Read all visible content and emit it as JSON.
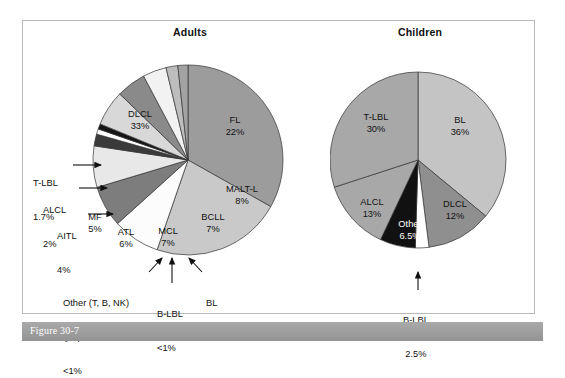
{
  "figure": {
    "caption_label": "Figure 30-7",
    "frame_color": "#b9b9b9",
    "caption_bar_color": "#9d9d9d"
  },
  "charts": [
    {
      "id": "adults",
      "title": "Adults",
      "center": [
        103,
        105
      ],
      "radius": 95
    },
    {
      "id": "children",
      "title": "Children",
      "center": [
        88,
        105
      ],
      "radius": 88
    }
  ],
  "chart_data": [
    {
      "type": "pie",
      "title": "Adults",
      "xlabel": "",
      "ylabel": "",
      "legend": "none",
      "unit": "%",
      "categories": [
        "DLCL",
        "FL",
        "MALT-L",
        "BCLL",
        "MCL",
        "BL",
        "B-LBL",
        "Other (T, B, NK) lymphomas",
        "ATL",
        "MF",
        "AITL",
        "ALCL",
        "T-LBL"
      ],
      "values": [
        33,
        22,
        8,
        7,
        7,
        2,
        0.9,
        0.9,
        6,
        5,
        4,
        2,
        1.7
      ],
      "value_labels": [
        "33%",
        "22%",
        "8%",
        "7%",
        "7%",
        "2%",
        "<1%",
        "<1%",
        "6%",
        "5%",
        "4%",
        "2%",
        "1.7%"
      ],
      "colors": [
        "#9c9c9c",
        "#c9c9c9",
        "#fcfcfc",
        "#7d7d7d",
        "#e8e8e8",
        "#3a3a3a",
        "#ffffff",
        "#151515",
        "#d8d8d8",
        "#8a8a8a",
        "#f2f2f2",
        "#bdbdbd",
        "#a3a3a3"
      ],
      "inside_labels": [
        {
          "name": "DLCL",
          "pct": "33%",
          "x": 55,
          "y": 60,
          "light": false
        },
        {
          "name": "FL",
          "pct": "22%",
          "x": 150,
          "y": 66,
          "light": false
        },
        {
          "name": "MALT-L",
          "pct": "8%",
          "x": 157,
          "y": 135,
          "light": false
        },
        {
          "name": "BCLL",
          "pct": "7%",
          "x": 128,
          "y": 163,
          "light": false
        },
        {
          "name": "MCL",
          "pct": "7%",
          "x": 83,
          "y": 177,
          "light": false
        },
        {
          "name": "ATL",
          "pct": "6%",
          "x": 41,
          "y": 178,
          "light": false
        },
        {
          "name": "MF",
          "pct": "5%",
          "x": 10,
          "y": 163,
          "light": false
        }
      ],
      "outside_labels": [
        {
          "name": "T-LBL",
          "pct": "1.7%",
          "arrow": "right"
        },
        {
          "name": "ALCL",
          "pct": "2%",
          "arrow": "right"
        },
        {
          "name": "AITL",
          "pct": "4%",
          "arrow": "right"
        },
        {
          "name": "Other (T, B, NK)\nlymphomas",
          "pct": "<1%",
          "arrow": "up-right"
        },
        {
          "name": "B-LBL",
          "pct": "<1%",
          "arrow": "up"
        },
        {
          "name": "BL",
          "pct": "2%",
          "arrow": "up-left"
        }
      ]
    },
    {
      "type": "pie",
      "title": "Children",
      "xlabel": "",
      "ylabel": "",
      "legend": "none",
      "unit": "%",
      "categories": [
        "BL",
        "DLCL",
        "B-LBL",
        "Other",
        "ALCL",
        "T-LBL"
      ],
      "values": [
        36,
        12,
        2.5,
        6.5,
        13,
        30
      ],
      "value_labels": [
        "36%",
        "12%",
        "2.5%",
        "6.5%",
        "13%",
        "30%"
      ],
      "colors": [
        "#c4c4c4",
        "#8f8f8f",
        "#ffffff",
        "#111111",
        "#a8a8a8",
        "#a8a8a8"
      ],
      "inside_labels": [
        {
          "name": "BL",
          "pct": "36%",
          "x": 130,
          "y": 66,
          "light": false
        },
        {
          "name": "T-LBL",
          "pct": "30%",
          "x": 46,
          "y": 63,
          "light": false
        },
        {
          "name": "ALCL",
          "pct": "13%",
          "x": 42,
          "y": 148,
          "light": false
        },
        {
          "name": "DLCL",
          "pct": "12%",
          "x": 125,
          "y": 150,
          "light": false
        },
        {
          "name": "Other",
          "pct": "6.5%",
          "x": 80,
          "y": 170,
          "light": true
        }
      ],
      "outside_labels": [
        {
          "name": "B-LBL",
          "pct": "2.5%",
          "arrow": "up"
        }
      ]
    }
  ],
  "adults_outside_text": {
    "tlbl_name": "T-LBL",
    "tlbl_pct": "1.7%",
    "alcl_name": "ALCL",
    "alcl_pct": "2%",
    "aitl_name": "AITL",
    "aitl_pct": "4%",
    "other_line1": "Other (T, B, NK)",
    "other_line2": "lymphomas",
    "other_pct": "<1%",
    "blbl_name": "B-LBL",
    "blbl_pct": "<1%",
    "bl_name": "BL",
    "bl_pct": "2%"
  },
  "children_outside_text": {
    "blbl_name": "B-LBL",
    "blbl_pct": "2.5%"
  }
}
